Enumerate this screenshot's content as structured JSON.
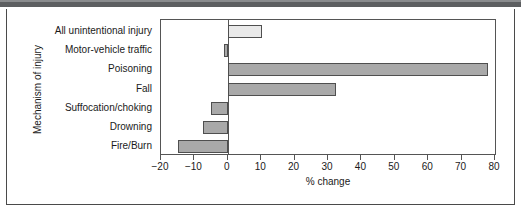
{
  "chart_data": {
    "type": "bar",
    "orientation": "horizontal",
    "title": "",
    "xlabel": "% change",
    "ylabel": "Mechanism of injury",
    "categories": [
      "All unintentional injury",
      "Motor-vehicle traffic",
      "Poisoning",
      "Fall",
      "Suffocation/choking",
      "Drowning",
      "Fire/Burn"
    ],
    "values": [
      10.3,
      -1.0,
      78.0,
      32.5,
      -5.0,
      -7.5,
      -15.0
    ],
    "bar_colors": [
      "#e9e9e9",
      "#a9a9a9",
      "#a9a9a9",
      "#a9a9a9",
      "#a9a9a9",
      "#a9a9a9",
      "#a9a9a9"
    ],
    "bar_border_color": "#4f4f4f",
    "xlim": [
      -20,
      80
    ],
    "xticks": [
      -20,
      -10,
      0,
      10,
      20,
      30,
      40,
      50,
      60,
      70,
      80
    ],
    "xtick_labels": [
      "−20",
      "−10",
      "0",
      "10",
      "20",
      "30",
      "40",
      "50",
      "60",
      "70",
      "80"
    ],
    "grid": false,
    "legend": false,
    "zero_line": 0,
    "axis_color": "#555555",
    "text_color": "#1a1a1a",
    "background": "#ffffff"
  }
}
